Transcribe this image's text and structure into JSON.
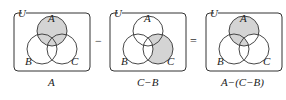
{
  "colors": {
    "shade": "#d4d4d4",
    "stroke": "#333333",
    "background": "#ffffff"
  },
  "diagrams": [
    {
      "universe_label": "U",
      "set_labels": [
        "A",
        "B",
        "C"
      ],
      "caption": "A"
    },
    {
      "universe_label": "U",
      "set_labels": [
        "A",
        "B",
        "C"
      ],
      "caption": "C−B"
    },
    {
      "universe_label": "U",
      "set_labels": [
        "A",
        "B",
        "C"
      ],
      "caption": "A−(C−B)"
    }
  ],
  "operators": [
    "−",
    "="
  ]
}
